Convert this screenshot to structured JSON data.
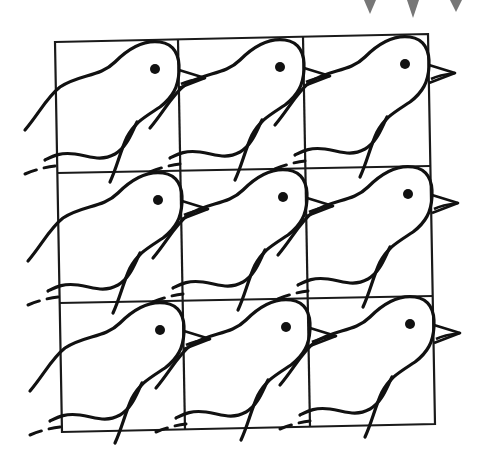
{
  "figure": {
    "title": "Tessellation of birds on a 3x3 square grid",
    "grid": {
      "rows": 3,
      "columns": 3
    },
    "motif": "bird",
    "colors": {
      "ink": "#111111",
      "background": "#ffffff",
      "partial_shape_top_right": "#777777"
    }
  }
}
